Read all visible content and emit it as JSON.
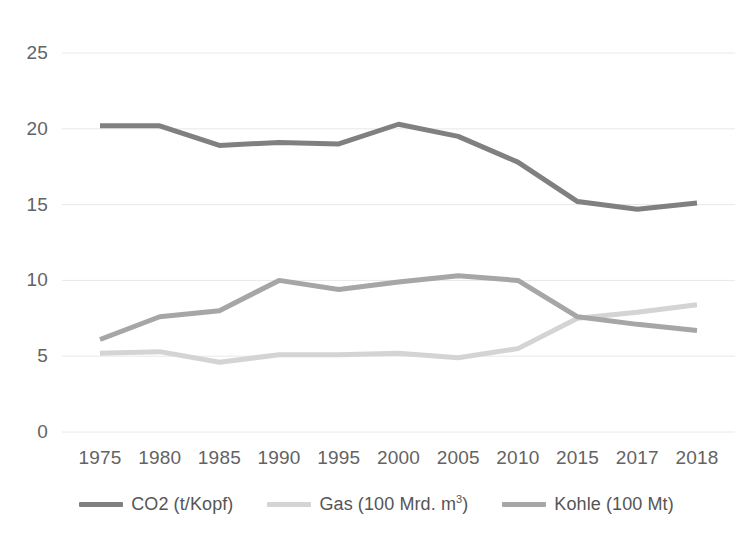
{
  "chart_data": {
    "type": "line",
    "title": "",
    "xlabel": "",
    "ylabel": "",
    "categories": [
      "1975",
      "1980",
      "1985",
      "1990",
      "1995",
      "2000",
      "2005",
      "2010",
      "2015",
      "2017",
      "2018"
    ],
    "ylim": [
      0,
      25
    ],
    "yticks": [
      "0",
      "5",
      "10",
      "15",
      "20",
      "25"
    ],
    "grid": "horizontal",
    "legend_position": "bottom",
    "series": [
      {
        "name": "CO2 (t/Kopf)",
        "color": "#808080",
        "values": [
          20.2,
          20.2,
          18.9,
          19.1,
          19.0,
          20.3,
          19.5,
          17.8,
          15.2,
          14.7,
          15.1
        ]
      },
      {
        "name": "Gas (100 Mrd. m³)",
        "color": "#d4d4d4",
        "values": [
          5.2,
          5.3,
          4.6,
          5.1,
          5.1,
          5.2,
          4.9,
          5.5,
          7.5,
          7.9,
          8.4
        ]
      },
      {
        "name": "Kohle (100 Mt)",
        "color": "#a6a6a6",
        "values": [
          6.1,
          7.6,
          8.0,
          10.0,
          9.4,
          9.9,
          10.3,
          10.0,
          7.6,
          7.1,
          6.7
        ]
      }
    ]
  },
  "legend": {
    "items": [
      {
        "label": "CO2 (t/Kopf)"
      },
      {
        "label_prefix": "Gas (100 Mrd. m",
        "label_sup": "3",
        "label_suffix": ")"
      },
      {
        "label": "Kohle (100 Mt)"
      }
    ]
  },
  "colors": {
    "axis_text": "#636363",
    "gridline": "#e8e8e8",
    "background": "#ffffff",
    "series_co2": "#808080",
    "series_gas": "#d4d4d4",
    "series_kohle": "#a6a6a6"
  }
}
